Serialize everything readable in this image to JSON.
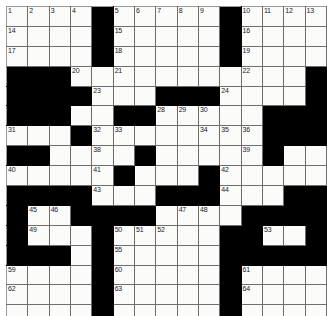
{
  "puzzle": {
    "type": "crossword-grid",
    "rows": 16,
    "cols": 15,
    "colors": {
      "block": "#000000",
      "cell": "#fbfbfa",
      "gridline": "#6e6e6e",
      "number": "#1a1a1a",
      "page_background": "#ffffff"
    },
    "blocks": [
      [
        0,
        4
      ],
      [
        0,
        10
      ],
      [
        1,
        4
      ],
      [
        1,
        10
      ],
      [
        2,
        4
      ],
      [
        2,
        10
      ],
      [
        3,
        0
      ],
      [
        3,
        1
      ],
      [
        3,
        2
      ],
      [
        3,
        14
      ],
      [
        4,
        0
      ],
      [
        4,
        1
      ],
      [
        4,
        2
      ],
      [
        4,
        3
      ],
      [
        4,
        7
      ],
      [
        4,
        8
      ],
      [
        4,
        9
      ],
      [
        4,
        14
      ],
      [
        5,
        0
      ],
      [
        5,
        1
      ],
      [
        5,
        2
      ],
      [
        5,
        5
      ],
      [
        5,
        6
      ],
      [
        5,
        12
      ],
      [
        5,
        13
      ],
      [
        5,
        14
      ],
      [
        6,
        3
      ],
      [
        6,
        12
      ],
      [
        6,
        13
      ],
      [
        6,
        14
      ],
      [
        7,
        0
      ],
      [
        7,
        1
      ],
      [
        7,
        6
      ],
      [
        7,
        12
      ],
      [
        8,
        5
      ],
      [
        8,
        9
      ],
      [
        9,
        0
      ],
      [
        9,
        1
      ],
      [
        9,
        2
      ],
      [
        9,
        3
      ],
      [
        9,
        7
      ],
      [
        9,
        8
      ],
      [
        9,
        9
      ],
      [
        9,
        13
      ],
      [
        9,
        14
      ],
      [
        10,
        0
      ],
      [
        10,
        3
      ],
      [
        10,
        4
      ],
      [
        10,
        5
      ],
      [
        10,
        6
      ],
      [
        10,
        11
      ],
      [
        10,
        12
      ],
      [
        10,
        13
      ],
      [
        10,
        14
      ],
      [
        11,
        0
      ],
      [
        11,
        4
      ],
      [
        11,
        10
      ],
      [
        11,
        11
      ],
      [
        11,
        14
      ],
      [
        12,
        0
      ],
      [
        12,
        1
      ],
      [
        12,
        2
      ],
      [
        12,
        4
      ],
      [
        12,
        10
      ],
      [
        12,
        11
      ],
      [
        12,
        12
      ],
      [
        12,
        13
      ],
      [
        12,
        14
      ],
      [
        13,
        4
      ],
      [
        13,
        10
      ],
      [
        14,
        4
      ],
      [
        14,
        10
      ],
      [
        15,
        4
      ],
      [
        15,
        10
      ]
    ],
    "numbers": [
      {
        "row": 0,
        "col": 0,
        "n": "1"
      },
      {
        "row": 0,
        "col": 1,
        "n": "2"
      },
      {
        "row": 0,
        "col": 2,
        "n": "3"
      },
      {
        "row": 0,
        "col": 3,
        "n": "4"
      },
      {
        "row": 0,
        "col": 5,
        "n": "5"
      },
      {
        "row": 0,
        "col": 6,
        "n": "6"
      },
      {
        "row": 0,
        "col": 7,
        "n": "7"
      },
      {
        "row": 0,
        "col": 8,
        "n": "8"
      },
      {
        "row": 0,
        "col": 9,
        "n": "9"
      },
      {
        "row": 0,
        "col": 11,
        "n": "10"
      },
      {
        "row": 0,
        "col": 12,
        "n": "11"
      },
      {
        "row": 0,
        "col": 13,
        "n": "12"
      },
      {
        "row": 0,
        "col": 14,
        "n": "13"
      },
      {
        "row": 1,
        "col": 0,
        "n": "14"
      },
      {
        "row": 1,
        "col": 5,
        "n": "15"
      },
      {
        "row": 1,
        "col": 11,
        "n": "16"
      },
      {
        "row": 2,
        "col": 0,
        "n": "17"
      },
      {
        "row": 2,
        "col": 5,
        "n": "18"
      },
      {
        "row": 2,
        "col": 11,
        "n": "19"
      },
      {
        "row": 3,
        "col": 3,
        "n": "20"
      },
      {
        "row": 3,
        "col": 5,
        "n": "21"
      },
      {
        "row": 3,
        "col": 11,
        "n": "22"
      },
      {
        "row": 4,
        "col": 4,
        "n": "23"
      },
      {
        "row": 4,
        "col": 10,
        "n": "24"
      },
      {
        "row": 5,
        "col": 0,
        "n": "25"
      },
      {
        "row": 5,
        "col": 1,
        "n": "26"
      },
      {
        "row": 5,
        "col": 2,
        "n": "27"
      },
      {
        "row": 5,
        "col": 7,
        "n": "28"
      },
      {
        "row": 5,
        "col": 8,
        "n": "29"
      },
      {
        "row": 5,
        "col": 9,
        "n": "30"
      },
      {
        "row": 6,
        "col": 0,
        "n": "31"
      },
      {
        "row": 6,
        "col": 4,
        "n": "32"
      },
      {
        "row": 6,
        "col": 5,
        "n": "33"
      },
      {
        "row": 6,
        "col": 9,
        "n": "34"
      },
      {
        "row": 6,
        "col": 10,
        "n": "35"
      },
      {
        "row": 6,
        "col": 11,
        "n": "36"
      },
      {
        "row": 7,
        "col": 0,
        "n": "37"
      },
      {
        "row": 7,
        "col": 4,
        "n": "38"
      },
      {
        "row": 7,
        "col": 11,
        "n": "39"
      },
      {
        "row": 8,
        "col": 0,
        "n": "40"
      },
      {
        "row": 8,
        "col": 4,
        "n": "41"
      },
      {
        "row": 8,
        "col": 10,
        "n": "42"
      },
      {
        "row": 9,
        "col": 4,
        "n": "43"
      },
      {
        "row": 9,
        "col": 10,
        "n": "44"
      },
      {
        "row": 10,
        "col": 1,
        "n": "45"
      },
      {
        "row": 10,
        "col": 2,
        "n": "46"
      },
      {
        "row": 10,
        "col": 8,
        "n": "47"
      },
      {
        "row": 10,
        "col": 9,
        "n": "48"
      },
      {
        "row": 11,
        "col": 1,
        "n": "49"
      },
      {
        "row": 11,
        "col": 5,
        "n": "50"
      },
      {
        "row": 11,
        "col": 6,
        "n": "51"
      },
      {
        "row": 11,
        "col": 7,
        "n": "52"
      },
      {
        "row": 11,
        "col": 12,
        "n": "53"
      },
      {
        "row": 12,
        "col": 0,
        "n": "54"
      },
      {
        "row": 12,
        "col": 5,
        "n": "55"
      },
      {
        "row": 12,
        "col": 11,
        "n": "56"
      },
      {
        "row": 12,
        "col": 13,
        "n": "57"
      },
      {
        "row": 12,
        "col": 14,
        "n": "58"
      },
      {
        "row": 13,
        "col": 0,
        "n": "59"
      },
      {
        "row": 13,
        "col": 5,
        "n": "60"
      },
      {
        "row": 13,
        "col": 11,
        "n": "61"
      },
      {
        "row": 14,
        "col": 0,
        "n": "62"
      },
      {
        "row": 14,
        "col": 5,
        "n": "63"
      },
      {
        "row": 14,
        "col": 11,
        "n": "64"
      }
    ],
    "letters": []
  }
}
